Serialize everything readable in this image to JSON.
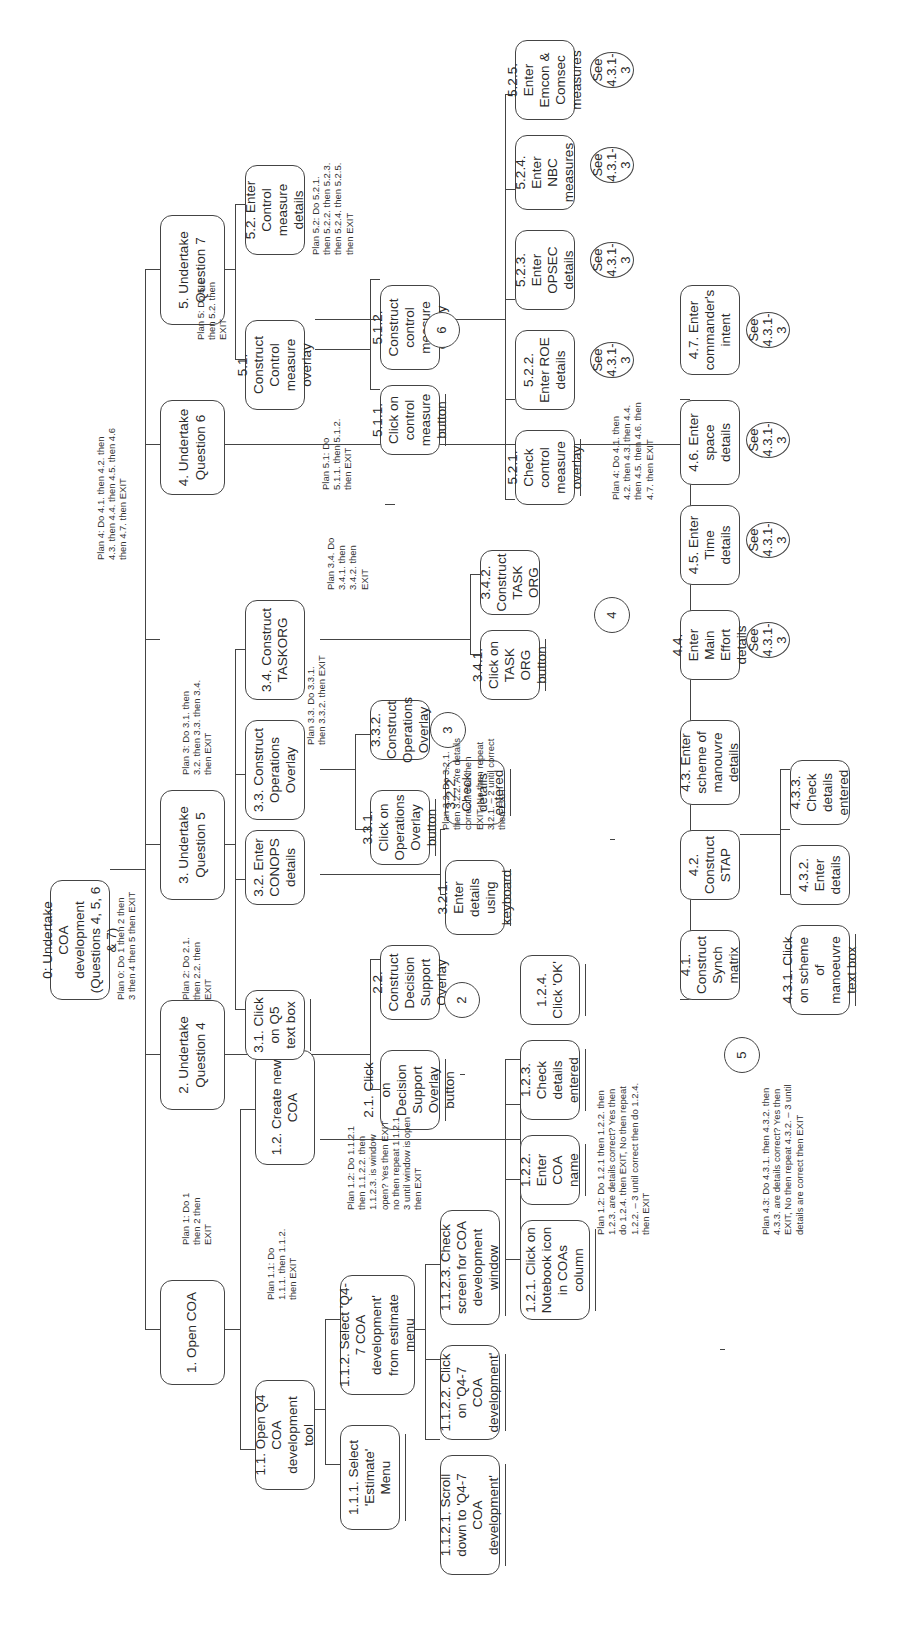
{
  "diagram": {
    "type": "hierarchical task analysis",
    "orientation": "rotated 90 degrees counter-clockwise",
    "nodes": {
      "n0": "0: Undertake COA development (Questions 4, 5, 6 & 7)",
      "n1": "1. Open COA",
      "n2": "2. Undertake Question 4",
      "n3": "3. Undertake Question 5",
      "n4": "4. Undertake Question 6",
      "n5": "5. Undertake Question 7",
      "n11": "1.1. Open Q4 COA development tool",
      "n12": "1.2. Create new COA",
      "n111": "1.1.1. Select 'Estimate' Menu",
      "n112": "1.1.2. Select 'Q4-7 COA development' from estimate menu",
      "n1121": "1.1.2.1. Scroll down to 'Q4-7 COA development'",
      "n1122": "1.1.2.2. Click on 'Q4-7 COA development'",
      "n1123": "1.1.2.3. Check screen for COA development window",
      "n121": "1.2.1. Click on Notebook icon in COAs column",
      "n122": "1.2.2. Enter COA name",
      "n123": "1.2.3. Check details entered",
      "n124": "1.2.4. Click 'OK'",
      "n21": "2.1. Click on Decision Support Overlay button",
      "n22": "2.2. Construct Decision Support Overlay",
      "n31": "3.1. Click on Q5 text box",
      "n32": "3.2. Enter CONOPS details",
      "n33": "3.3. Construct Operations Overlay",
      "n34": "3.4. Construct TASKORG",
      "n321": "3.2.1. Enter details using keyboard",
      "n322": "3.2.2. Check details entered",
      "n331": "3.3.1. Click on Operations Overlay button",
      "n332": "3.3.2. Construct Operations Overlay",
      "n341": "3.4.1. Click on TASK ORG button",
      "n342": "3.4.2. Construct TASK ORG",
      "n41": "4.1. Construct Synch matrix",
      "n42": "4.2. Construct STAP",
      "n43": "4.3. Enter scheme of manouvre details",
      "n44": "4.4. Enter Main Effort details",
      "n45": "4.5. Enter Time details",
      "n46": "4.6. Enter space details",
      "n47": "4.7. Enter commander's intent",
      "n431": "4.3.1. Click on scheme of manoeuvre text box",
      "n432": "4.3.2. Enter details",
      "n433": "4.3.3. Check details entered",
      "n51": "5.1. Construct Control measure overlay",
      "n52": "5.2. Enter Control measure details",
      "n511": "5.1.1. Click on control measure button",
      "n512": "5.1.2. Construct control measure overlay",
      "n521": "5.2.1. Check control measure overlay",
      "n522": "5.2.2. Enter ROE details",
      "n523": "5.2.3. Enter OPSEC details",
      "n524": "5.2.4. Enter NBC measures",
      "n525": "5.2.5. Enter Emcon & Comsec measures"
    },
    "connectors": {
      "c2": "2",
      "c3": "3",
      "c4": "4",
      "c5": "5",
      "c6": "6",
      "see": "See 4.3.1-3"
    },
    "plans": {
      "p0": "Plan 0: Do 1 then 2 then\n3 then 4 then 5 then EXIT",
      "p1": "Plan 1: Do 1\nthen 2 then\nEXIT",
      "p11": "Plan 1.1: Do\n1.1.1. then 1.1.2.\nthen EXIT",
      "p112": "Plan 1.2: Do 1.1.2.1\nthen 1.1.2.2. then\n1.1.2.3. is window\nopen? Yes then EXIT\nno then repeat 1.1.2.1 –\n3 until window is open\nthen EXIT",
      "p12": "Plan 1.2: Do 1.2.1 then 1.2.2. then\n1.2.3. are details correct? Yes then\ndo 1.2.4. then EXIT, No then repeat\n1.2.2. – 3 until correct then do 1.2.4.\nthen EXIT",
      "p2": "Plan 2: Do 2.1.\nthen 2.2. then\nEXIT",
      "p3": "Plan 3: Do 3.1. then\n3.2. then 3.3. then 3.4.\nthen EXIT",
      "p32": "Plan 3.2. Do 3.2.1.\nthen 3.2.2. Are details\ncorrect? Yes then\nEXIT, No then repeat\n3.2.1. – 2 until correct\nthen EXIT",
      "p33": "Plan 3.3. Do 3.3.1.\nthen 3.3.2. then EXIT",
      "p34": "Plan 3.4. Do\n3.4.1. then\n3.4.2. then\nEXIT",
      "p4top": "Plan 4: Do 4.1. then 4.2. then\n4.3. then 4.4. then 4.5. then 4.6\nthen 4.7. then EXIT",
      "p4": "Plan 4: Do 4.1. then\n4.2. then 4.3. then 4.4.\nthen 4.5. then 4.6. then\n4.7. then EXIT",
      "p43": "Plan 4.3: Do 4.3.1. then 4.3.2. then\n4.3.3. are details correct? Yes then\nEXIT, No then repeat 4.3.2. – 3 until\ndetails are correct then EXIT",
      "p5": "Plan 5: Do 5.1.\nthen 5.2. then\nEXIT",
      "p51": "Plan 5.1: Do\n5.1.1. then 5.1.2.\nthen EXIT",
      "p52": "Plan 5.2: Do 5.2.1.\nthen 5.2.2. then 5.2.3.\nthen 5.2.4. then 5.2.5.\nthen EXIT"
    }
  }
}
